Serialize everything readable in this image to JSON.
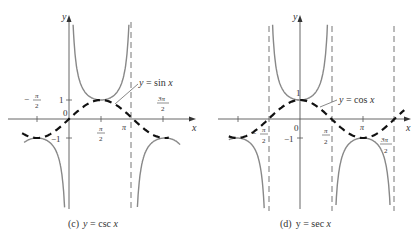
{
  "figures": [
    {
      "id": "c",
      "caption": "(c)  y  =  csc x",
      "function": "csc",
      "reference_curve": "sin",
      "reference_label": "y  =  sin x",
      "axis_labels": {
        "x": "x",
        "y": "y"
      },
      "tick_labels": {
        "neg_pi_over_2": "−",
        "pi_over_2": "π/2",
        "pi": "π",
        "three_pi_over_2": "3π/2",
        "one": "1",
        "neg_one": "−1",
        "zero": "0"
      }
    },
    {
      "id": "d",
      "caption": "(d)  y  =  sec x",
      "function": "sec",
      "reference_curve": "cos",
      "reference_label": "y  =  cos x",
      "axis_labels": {
        "x": "x",
        "y": "y"
      },
      "tick_labels": {
        "neg_pi_over_2": "−",
        "pi_over_2": "π/2",
        "pi": "π",
        "three_pi_over_2": "3π/2",
        "one": "1",
        "neg_one": "−1",
        "zero": "0"
      }
    }
  ],
  "text": {
    "pi": "π",
    "two": "2",
    "three_pi": "3π",
    "minus": "−",
    "c_caption_prefix": "(c)",
    "c_caption_eq": "y  =  csc",
    "c_caption_var": "x",
    "d_caption_prefix": "(d)",
    "d_caption_eq": "y  =  sec",
    "d_caption_var": "x",
    "sin_label": "y  =  sin",
    "cos_label": "y  =  cos",
    "var_x": "x",
    "var_y": "y",
    "one": "1",
    "neg_one": "−1",
    "zero": "0"
  },
  "colors": {
    "axis": "#555555",
    "curve": "#888888",
    "dashed": "#111111",
    "asymptote": "#666666"
  }
}
